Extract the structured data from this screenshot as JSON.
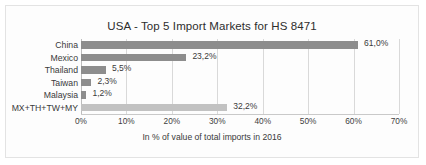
{
  "chart_data": {
    "type": "bar",
    "orientation": "horizontal",
    "title": "USA - Top 5 Import Markets for HS 8471",
    "xlabel": "In % of value of total imports in 2016",
    "ylabel": "",
    "xlim": [
      0,
      70
    ],
    "grid": true,
    "legend": "none",
    "categories": [
      "China",
      "Mexico",
      "Thailand",
      "Taiwan",
      "Malaysia",
      "MX+TH+TW+MY"
    ],
    "values": [
      61.0,
      23.2,
      5.5,
      2.3,
      1.2,
      32.2
    ],
    "data_labels": [
      "61,0%",
      "23,2%",
      "5,5%",
      "2,3%",
      "1,2%",
      "32,2%"
    ],
    "bar_colors": [
      "#8d8d8d",
      "#8d8d8d",
      "#8d8d8d",
      "#8d8d8d",
      "#8d8d8d",
      "#c2c2c2"
    ],
    "xticks": [
      0,
      10,
      20,
      30,
      40,
      50,
      60,
      70
    ],
    "xtick_labels": [
      "0%",
      "10%",
      "20%",
      "30%",
      "40%",
      "50%",
      "60%",
      "70%"
    ]
  },
  "colors": {
    "bar_primary": "#8d8d8d",
    "bar_aggregate": "#c2c2c2",
    "gridline": "#d9d9d9",
    "text": "#3a3a3a",
    "frame_border": "#e3e3e3",
    "background": "#fdfdfd"
  }
}
